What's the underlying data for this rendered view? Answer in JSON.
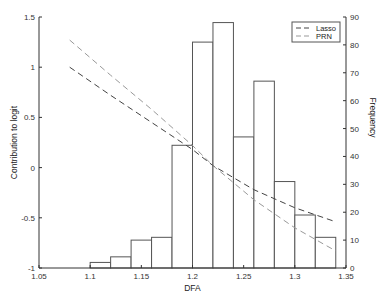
{
  "chart_data": {
    "type": "bar+line",
    "title": "",
    "xlabel": "DFA",
    "ylabel_left": "Contribution to logit",
    "ylabel_right": "Frequency",
    "xlim": [
      1.05,
      1.35
    ],
    "ylim_left": [
      -1,
      1.5
    ],
    "ylim_right": [
      0,
      90
    ],
    "x_ticks": [
      "1.05",
      "1.1",
      "1.15",
      "1.2",
      "1.25",
      "1.3",
      "1.35"
    ],
    "y_left_ticks": [
      "-1",
      "-0.5",
      "0",
      "0.5",
      "1",
      "1.5"
    ],
    "y_right_ticks": [
      "0",
      "10",
      "20",
      "30",
      "40",
      "50",
      "60",
      "70",
      "80",
      "90"
    ],
    "grid": false,
    "legend_position": "upper right",
    "histogram": {
      "name": "Frequency",
      "bin_edges": [
        1.1,
        1.12,
        1.14,
        1.16,
        1.18,
        1.2,
        1.22,
        1.24,
        1.26,
        1.28,
        1.3,
        1.32,
        1.34
      ],
      "counts": [
        2,
        4,
        10,
        11,
        44,
        81,
        88,
        47,
        67,
        31,
        19,
        11
      ]
    },
    "series": [
      {
        "name": "Lasso",
        "style": "dashed",
        "color": "#444444",
        "x": [
          1.08,
          1.12,
          1.16,
          1.2,
          1.22,
          1.26,
          1.3,
          1.34
        ],
        "y": [
          1.0,
          0.72,
          0.45,
          0.18,
          0.02,
          -0.22,
          -0.4,
          -0.54
        ]
      },
      {
        "name": "PRN",
        "style": "dashed",
        "color": "#999999",
        "x": [
          1.08,
          1.12,
          1.16,
          1.2,
          1.22,
          1.26,
          1.3,
          1.34
        ],
        "y": [
          1.27,
          0.92,
          0.58,
          0.22,
          0.02,
          -0.32,
          -0.6,
          -0.83
        ]
      }
    ]
  },
  "legend": {
    "items": [
      {
        "label": "Lasso"
      },
      {
        "label": "PRN"
      }
    ]
  }
}
